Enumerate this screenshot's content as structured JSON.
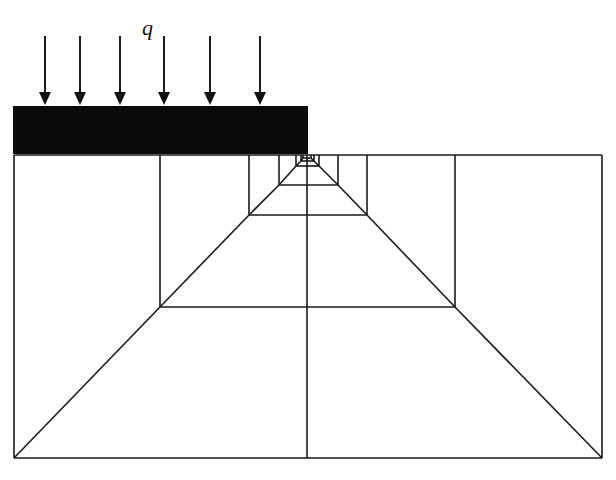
{
  "figure": {
    "load_label": "q",
    "colors": {
      "stroke": "#1a1a1a",
      "footing": "#0a0a0a",
      "background": "#ffffff"
    }
  },
  "load": {
    "label": "q",
    "label_pos": [
      142,
      35
    ],
    "arrows_x": [
      45,
      80,
      120,
      164,
      210,
      260
    ],
    "arrow_top_y": 36,
    "arrow_tip_y": 105
  },
  "footing": {
    "x": 13,
    "y": 106,
    "width": 295,
    "height": 48
  },
  "mesh": {
    "outer": {
      "left": 14,
      "top": 155,
      "right": 602,
      "bottom": 458
    },
    "center_x": 307,
    "levels": [
      {
        "left": 160,
        "right": 455,
        "bottom": 307
      },
      {
        "left": 249,
        "right": 367,
        "bottom": 215
      },
      {
        "left": 279,
        "right": 338,
        "bottom": 185
      },
      {
        "left": 296,
        "right": 319,
        "bottom": 166
      },
      {
        "left": 301,
        "right": 314,
        "bottom": 161
      },
      {
        "left": 303,
        "right": 311,
        "bottom": 158
      }
    ]
  }
}
